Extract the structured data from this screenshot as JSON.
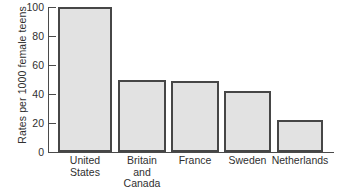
{
  "chart_data": {
    "type": "bar",
    "title": "",
    "subtitle": "",
    "xlabel": "",
    "ylabel": "Rates per 1000 female teens",
    "categories": [
      "United States",
      "Britain and Canada",
      "France",
      "Sweden",
      "Netherlands"
    ],
    "category_lines": [
      [
        "United",
        "States"
      ],
      [
        "Britain",
        "and",
        "Canada"
      ],
      [
        "France"
      ],
      [
        "Sweden"
      ],
      [
        "Netherlands"
      ]
    ],
    "values": [
      100,
      50,
      49,
      42,
      22
    ],
    "ylim": [
      0,
      100
    ],
    "yticks": [
      0,
      20,
      40,
      60,
      80,
      100
    ],
    "ytick_labels": [
      "0",
      "20",
      "40",
      "60",
      "80",
      "100"
    ],
    "grid": false,
    "legend": null,
    "bar_fill_color": "#e2e2e2",
    "bar_border_color": "#464646",
    "axis_color": "#4a4a4a",
    "background_color": "#ffffff"
  }
}
